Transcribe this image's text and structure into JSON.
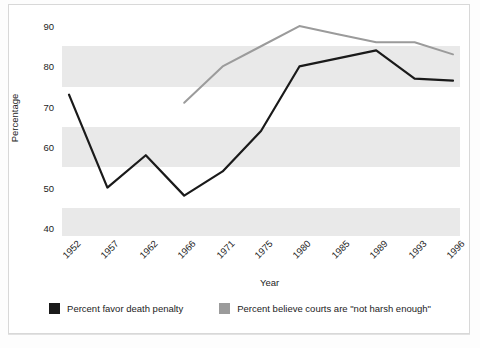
{
  "chart_data": {
    "type": "line",
    "title": "",
    "subtitle": "",
    "xlabel": "Year",
    "ylabel": "Percentage",
    "categories": [
      "1952",
      "1957",
      "1962",
      "1966",
      "1971",
      "1975",
      "1980",
      "1985",
      "1989",
      "1993",
      "1996"
    ],
    "xtick_labels": [
      "1952",
      "1957",
      "1962",
      "1966",
      "1971",
      "1975",
      "1980",
      "1985",
      "1989",
      "1993",
      "1996"
    ],
    "ytick_labels": [
      "40",
      "50",
      "60",
      "70",
      "80",
      "90"
    ],
    "ytick_values": [
      40,
      50,
      60,
      70,
      80,
      90
    ],
    "ylim": [
      38,
      92
    ],
    "grid": "horizontal-bands",
    "legend_position": "bottom-center",
    "series": [
      {
        "name": "Percent favor death penalty",
        "color": "#1a1a1a",
        "values": [
          73,
          50,
          58,
          48,
          54,
          64,
          80,
          82,
          84,
          77,
          76.5
        ]
      },
      {
        "name": "Percent believe courts are \"not harsh enough\"",
        "color": "#9b9b9b",
        "values": [
          null,
          null,
          null,
          71,
          80,
          85,
          90,
          88,
          86,
          86,
          83
        ]
      }
    ]
  },
  "axes": {
    "ylabel": "Percentage",
    "xlabel": "Year"
  },
  "legend": {
    "items": [
      {
        "label": "Percent favor death penalty",
        "color": "#1a1a1a"
      },
      {
        "label": "Percent believe courts are \"not harsh enough\"",
        "color": "#9b9b9b"
      }
    ]
  },
  "colors": {
    "series_black": "#1a1a1a",
    "series_gray": "#9b9b9b",
    "band": "#e9e9e9",
    "plot_background": "#ffffff",
    "frame": "#d8d8d8"
  }
}
